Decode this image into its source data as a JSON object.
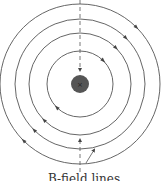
{
  "diagram": {
    "type": "magnetic-field-lines-around-wire",
    "center": {
      "x": 80,
      "y": 84
    },
    "wire": {
      "radius": 9,
      "color": "#555555",
      "symbol": "×"
    },
    "circles": [
      {
        "r": 33
      },
      {
        "r": 51
      },
      {
        "r": 65
      },
      {
        "r": 80
      }
    ],
    "field_direction": "clockwise",
    "line_color": "#555555",
    "caption": "B-field lines"
  }
}
